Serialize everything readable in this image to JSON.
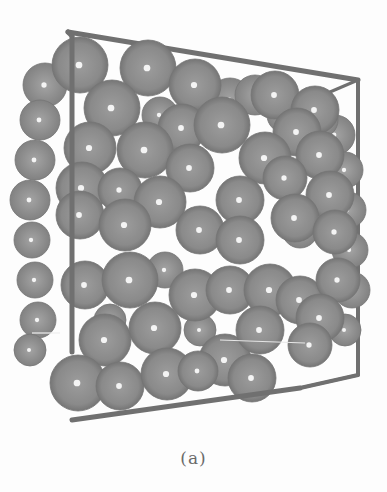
{
  "figure": {
    "caption": "(a)",
    "colors": {
      "background": "#fdfdfd",
      "sphere_base": "#8e8e8e",
      "sphere_shadow": "#6a6a6a",
      "sphere_highlight": "#f4f4f4",
      "frame": "#707070"
    },
    "frame": {
      "back_top_left": [
        68,
        32
      ],
      "back_top_right": [
        358,
        80
      ],
      "right_bottom": [
        358,
        375
      ],
      "front_bottom_left": [
        72,
        420
      ],
      "front_left_top": [
        72,
        36
      ]
    },
    "spheres_back": [
      [
        45,
        85,
        22
      ],
      [
        40,
        120,
        20
      ],
      [
        35,
        160,
        20
      ],
      [
        30,
        200,
        20
      ],
      [
        32,
        240,
        18
      ],
      [
        35,
        280,
        18
      ],
      [
        38,
        320,
        18
      ],
      [
        30,
        350,
        16
      ],
      [
        230,
        100,
        22
      ],
      [
        255,
        95,
        20
      ],
      [
        335,
        135,
        20
      ],
      [
        345,
        170,
        18
      ],
      [
        348,
        210,
        18
      ],
      [
        350,
        250,
        18
      ],
      [
        352,
        290,
        18
      ],
      [
        345,
        330,
        16
      ],
      [
        160,
        115,
        18
      ],
      [
        285,
        115,
        18
      ],
      [
        320,
        120,
        18
      ],
      [
        165,
        270,
        18
      ],
      [
        110,
        320,
        16
      ],
      [
        200,
        330,
        16
      ],
      [
        300,
        230,
        18
      ],
      [
        230,
        290,
        16
      ]
    ],
    "spheres_front": [
      [
        80,
        65,
        28
      ],
      [
        148,
        68,
        28
      ],
      [
        195,
        85,
        26
      ],
      [
        275,
        95,
        24
      ],
      [
        315,
        110,
        24
      ],
      [
        112,
        108,
        28
      ],
      [
        182,
        128,
        24
      ],
      [
        222,
        125,
        28
      ],
      [
        297,
        132,
        24
      ],
      [
        90,
        148,
        26
      ],
      [
        145,
        150,
        28
      ],
      [
        190,
        168,
        24
      ],
      [
        265,
        158,
        26
      ],
      [
        320,
        155,
        24
      ],
      [
        82,
        188,
        26
      ],
      [
        120,
        190,
        22
      ],
      [
        160,
        202,
        26
      ],
      [
        240,
        200,
        24
      ],
      [
        285,
        178,
        22
      ],
      [
        330,
        195,
        24
      ],
      [
        80,
        215,
        24
      ],
      [
        125,
        225,
        26
      ],
      [
        200,
        230,
        24
      ],
      [
        240,
        240,
        24
      ],
      [
        295,
        218,
        24
      ],
      [
        335,
        232,
        22
      ],
      [
        85,
        285,
        24
      ],
      [
        130,
        280,
        28
      ],
      [
        195,
        295,
        26
      ],
      [
        230,
        290,
        24
      ],
      [
        270,
        290,
        26
      ],
      [
        300,
        300,
        24
      ],
      [
        338,
        280,
        22
      ],
      [
        105,
        340,
        26
      ],
      [
        155,
        328,
        26
      ],
      [
        225,
        360,
        26
      ],
      [
        260,
        330,
        24
      ],
      [
        320,
        318,
        24
      ],
      [
        310,
        345,
        22
      ],
      [
        78,
        383,
        28
      ],
      [
        120,
        386,
        24
      ],
      [
        167,
        374,
        26
      ],
      [
        198,
        371,
        20
      ],
      [
        252,
        378,
        24
      ]
    ]
  }
}
